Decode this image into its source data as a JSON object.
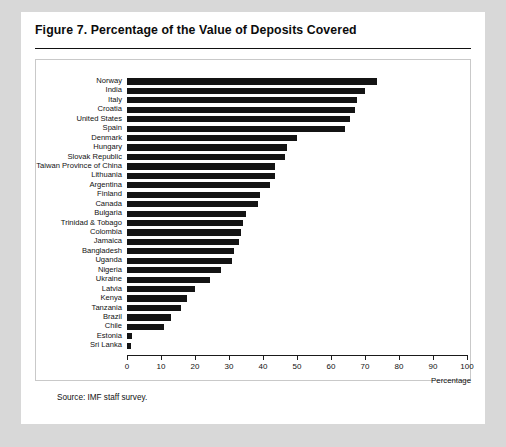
{
  "figure": {
    "title": "Figure 7.  Percentage of the Value of Deposits Covered",
    "source": "Source:  IMF staff survey."
  },
  "chart_data": {
    "type": "bar",
    "orientation": "horizontal",
    "title": "Figure 7.  Percentage of the Value of Deposits Covered",
    "xlabel": "Percentage",
    "ylabel": "",
    "xlim": [
      0,
      100
    ],
    "xticks": [
      0,
      10,
      20,
      30,
      40,
      50,
      60,
      70,
      80,
      90,
      100
    ],
    "xtick_labels": [
      "0",
      "10",
      "20",
      "30",
      "40",
      "50",
      "60",
      "70",
      "80",
      "90",
      "100"
    ],
    "grid": false,
    "legend": null,
    "bar_color": "#141414",
    "categories": [
      "Norway",
      "India",
      "Italy",
      "Croatia",
      "United States",
      "Spain",
      "Denmark",
      "Hungary",
      "Slovak Republic",
      "Taiwan Province of China",
      "Lithuania",
      "Argentina",
      "Finland",
      "Canada",
      "Bulgaria",
      "Trinidad & Tobago",
      "Colombia",
      "Jamaica",
      "Bangladesh",
      "Uganda",
      "Nigeria",
      "Ukraine",
      "Latvia",
      "Kenya",
      "Tanzania",
      "Brazil",
      "Chile",
      "Estonia",
      "Sri Lanka"
    ],
    "values": [
      73.5,
      70.0,
      67.6,
      67.0,
      65.5,
      64.0,
      50.0,
      47.0,
      46.5,
      43.5,
      43.5,
      42.0,
      39.0,
      38.5,
      35.0,
      34.0,
      33.5,
      33.0,
      31.5,
      31.0,
      27.5,
      24.5,
      20.0,
      17.5,
      16.0,
      13.0,
      11.0,
      1.5,
      1.2
    ],
    "xtick_positions_px": [
      0,
      34,
      68,
      102,
      136,
      170,
      204,
      238,
      272,
      306,
      340
    ]
  }
}
